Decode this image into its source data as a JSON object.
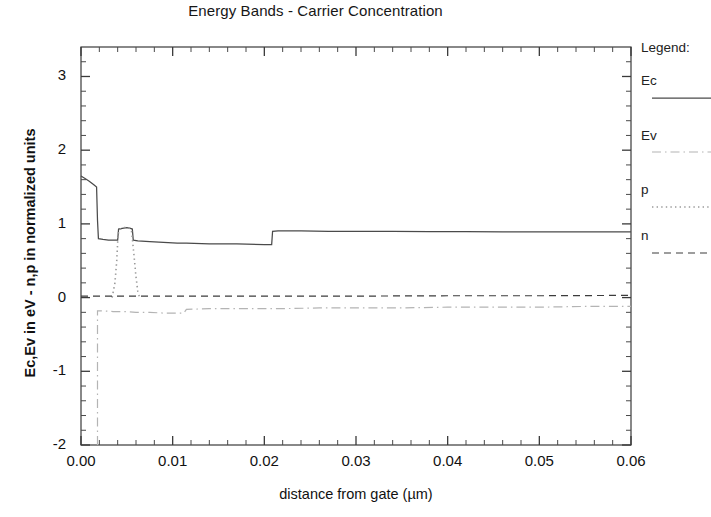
{
  "chart_data": {
    "type": "line",
    "title": "Energy Bands - Carrier Concentration",
    "xlabel": "distance from gate (µm)",
    "ylabel": "Ec,Ev in eV - n,p in normalized units",
    "xlim": [
      0.0,
      0.06
    ],
    "ylim": [
      -2,
      3.4
    ],
    "xticks": [
      "0.00",
      "0.01",
      "0.02",
      "0.03",
      "0.04",
      "0.05",
      "0.06"
    ],
    "xtick_values": [
      0.0,
      0.01,
      0.02,
      0.03,
      0.04,
      0.05,
      0.06
    ],
    "yticks": [
      "-2",
      "-1",
      "0",
      "1",
      "2",
      "3"
    ],
    "ytick_values": [
      -2,
      -1,
      0,
      1,
      2,
      3
    ],
    "minor_ticks_per_interval": 5,
    "grid": false,
    "legend_position": "right outside",
    "legend_title": "Legend:",
    "series": [
      {
        "name": "Ec",
        "style": "solid",
        "color": "#4a4a4a",
        "points": [
          [
            0.0,
            1.65
          ],
          [
            0.0004,
            1.62
          ],
          [
            0.0009,
            1.58
          ],
          [
            0.0014,
            1.53
          ],
          [
            0.0017,
            1.5
          ],
          [
            0.0018,
            1.05
          ],
          [
            0.0019,
            0.8
          ],
          [
            0.0024,
            0.79
          ],
          [
            0.003,
            0.78
          ],
          [
            0.0036,
            0.78
          ],
          [
            0.004,
            0.78
          ],
          [
            0.0041,
            0.93
          ],
          [
            0.0045,
            0.94
          ],
          [
            0.005,
            0.95
          ],
          [
            0.0054,
            0.94
          ],
          [
            0.0056,
            0.93
          ],
          [
            0.0057,
            0.78
          ],
          [
            0.0062,
            0.77
          ],
          [
            0.0075,
            0.76
          ],
          [
            0.009,
            0.75
          ],
          [
            0.0105,
            0.74
          ],
          [
            0.0115,
            0.74
          ],
          [
            0.014,
            0.73
          ],
          [
            0.017,
            0.73
          ],
          [
            0.02,
            0.72
          ],
          [
            0.0208,
            0.72
          ],
          [
            0.0209,
            0.9
          ],
          [
            0.0215,
            0.905
          ],
          [
            0.024,
            0.905
          ],
          [
            0.027,
            0.9
          ],
          [
            0.03,
            0.9
          ],
          [
            0.034,
            0.898
          ],
          [
            0.038,
            0.896
          ],
          [
            0.042,
            0.894
          ],
          [
            0.046,
            0.893
          ],
          [
            0.05,
            0.892
          ],
          [
            0.054,
            0.892
          ],
          [
            0.058,
            0.891
          ],
          [
            0.06,
            0.891
          ]
        ]
      },
      {
        "name": "Ev",
        "style": "dashdot",
        "color": "#b4b4b4",
        "points": [
          [
            0.0018,
            -2.0
          ],
          [
            0.0018,
            -0.18
          ],
          [
            0.0024,
            -0.18
          ],
          [
            0.0035,
            -0.19
          ],
          [
            0.0048,
            -0.19
          ],
          [
            0.006,
            -0.2
          ],
          [
            0.0075,
            -0.2
          ],
          [
            0.009,
            -0.21
          ],
          [
            0.0105,
            -0.21
          ],
          [
            0.0112,
            -0.21
          ],
          [
            0.0115,
            -0.16
          ],
          [
            0.014,
            -0.15
          ],
          [
            0.018,
            -0.15
          ],
          [
            0.022,
            -0.15
          ],
          [
            0.026,
            -0.14
          ],
          [
            0.03,
            -0.14
          ],
          [
            0.035,
            -0.14
          ],
          [
            0.04,
            -0.13
          ],
          [
            0.045,
            -0.13
          ],
          [
            0.05,
            -0.13
          ],
          [
            0.055,
            -0.12
          ],
          [
            0.06,
            -0.12
          ]
        ]
      },
      {
        "name": "p",
        "style": "dotted",
        "color": "#9a9a9a",
        "points": [
          [
            0.0034,
            0.0
          ],
          [
            0.0037,
            0.2
          ],
          [
            0.0039,
            0.5
          ],
          [
            0.004,
            0.75
          ],
          [
            0.0041,
            0.9
          ],
          [
            0.0043,
            0.93
          ],
          [
            0.0046,
            0.95
          ],
          [
            0.005,
            0.95
          ],
          [
            0.0053,
            0.94
          ],
          [
            0.0055,
            0.92
          ],
          [
            0.0056,
            0.8
          ],
          [
            0.0058,
            0.55
          ],
          [
            0.006,
            0.28
          ],
          [
            0.0062,
            0.08
          ],
          [
            0.0064,
            0.0
          ]
        ]
      },
      {
        "name": "n",
        "style": "dashed",
        "color": "#3c3c3c",
        "points": [
          [
            0.0,
            0.02
          ],
          [
            0.01,
            0.02
          ],
          [
            0.02,
            0.02
          ],
          [
            0.03,
            0.02
          ],
          [
            0.04,
            0.025
          ],
          [
            0.05,
            0.025
          ],
          [
            0.06,
            0.03
          ]
        ]
      }
    ]
  },
  "legend": {
    "title": "Legend:",
    "entries": [
      {
        "label": "Ec",
        "style": "solid"
      },
      {
        "label": "Ev",
        "style": "dashdot"
      },
      {
        "label": "p",
        "style": "dotted"
      },
      {
        "label": "n",
        "style": "dashed"
      }
    ]
  },
  "axes": {
    "title": "Energy Bands - Carrier Concentration",
    "xlabel": "distance from gate (µm)",
    "ylabel": "Ec,Ev in eV - n,p in normalized units"
  }
}
